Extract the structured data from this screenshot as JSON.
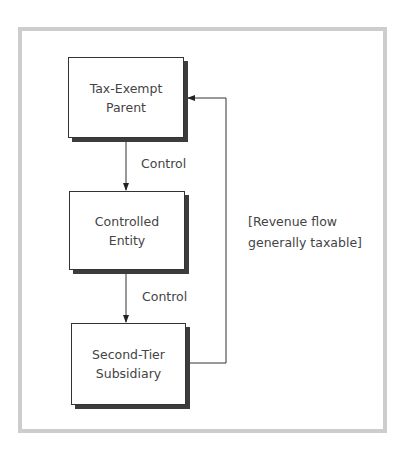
{
  "diagram": {
    "nodes": [
      {
        "id": "parent",
        "lines": [
          "Tax-Exempt",
          "Parent"
        ]
      },
      {
        "id": "controlled",
        "lines": [
          "Controlled",
          "Entity"
        ]
      },
      {
        "id": "subsidiary",
        "lines": [
          "Second-Tier",
          "Subsidiary"
        ]
      }
    ],
    "edges": [
      {
        "from": "parent",
        "to": "controlled",
        "label": "Control"
      },
      {
        "from": "controlled",
        "to": "subsidiary",
        "label": "Control"
      },
      {
        "from": "subsidiary",
        "to": "parent",
        "label": "[Revenue flow generally taxable]"
      }
    ],
    "revenue_label": [
      "[Revenue flow",
      "generally taxable]"
    ],
    "colors": {
      "frame": "#cdcdcd",
      "line": "#333333",
      "shadow": "#3c3c3c"
    }
  }
}
